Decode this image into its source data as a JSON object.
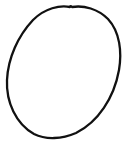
{
  "drawing": {
    "shape": "hand-drawn-oval",
    "stroke_color": "#111111",
    "background_color": "#ffffff"
  }
}
